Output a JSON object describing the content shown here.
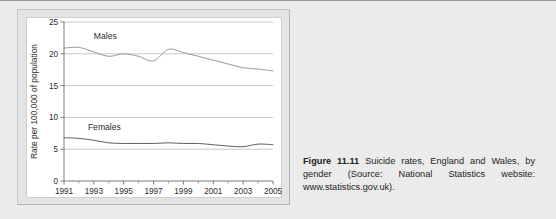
{
  "figure": {
    "caption_lead": "Figure 11.11",
    "caption_body": "Suicide rates, England and Wales, by gender (Source: National Statistics website: www.statistics.gov.uk)."
  },
  "chart_data": {
    "type": "line",
    "title": "",
    "xlabel": "",
    "ylabel": "Rate per 100,000 of population",
    "xlim": [
      1991,
      2005
    ],
    "ylim": [
      0,
      25
    ],
    "grid": true,
    "legend_position": "inline-labels",
    "x": [
      1991,
      1992,
      1993,
      1994,
      1995,
      1996,
      1997,
      1998,
      1999,
      2000,
      2001,
      2002,
      2003,
      2004,
      2005
    ],
    "y_ticks": [
      "0",
      "5",
      "10",
      "15",
      "20",
      "25"
    ],
    "y_tick_values": [
      0,
      5,
      10,
      15,
      20,
      25
    ],
    "x_ticks": [
      "1991",
      "1993",
      "1995",
      "1997",
      "1999",
      "2001",
      "2003",
      "2005"
    ],
    "x_tick_values": [
      1991,
      1993,
      1995,
      1997,
      1999,
      2001,
      2003,
      2005
    ],
    "x_minor_ticks": [
      1992,
      1994,
      1996,
      1998,
      2000,
      2002,
      2004
    ],
    "series": [
      {
        "name": "Males",
        "color": "#9a9a9a",
        "label_x": 1993.0,
        "label_y": 22.4,
        "values": [
          20.9,
          21.0,
          20.3,
          19.6,
          20.0,
          19.6,
          18.9,
          20.7,
          20.2,
          19.6,
          19.0,
          18.4,
          17.8,
          17.6,
          17.3
        ]
      },
      {
        "name": "Females",
        "color": "#5f5f5f",
        "label_x": 1992.6,
        "label_y": 8.0,
        "values": [
          6.8,
          6.7,
          6.4,
          6.0,
          5.9,
          5.9,
          5.9,
          6.0,
          5.9,
          5.9,
          5.7,
          5.5,
          5.4,
          5.8,
          5.7
        ]
      }
    ]
  }
}
